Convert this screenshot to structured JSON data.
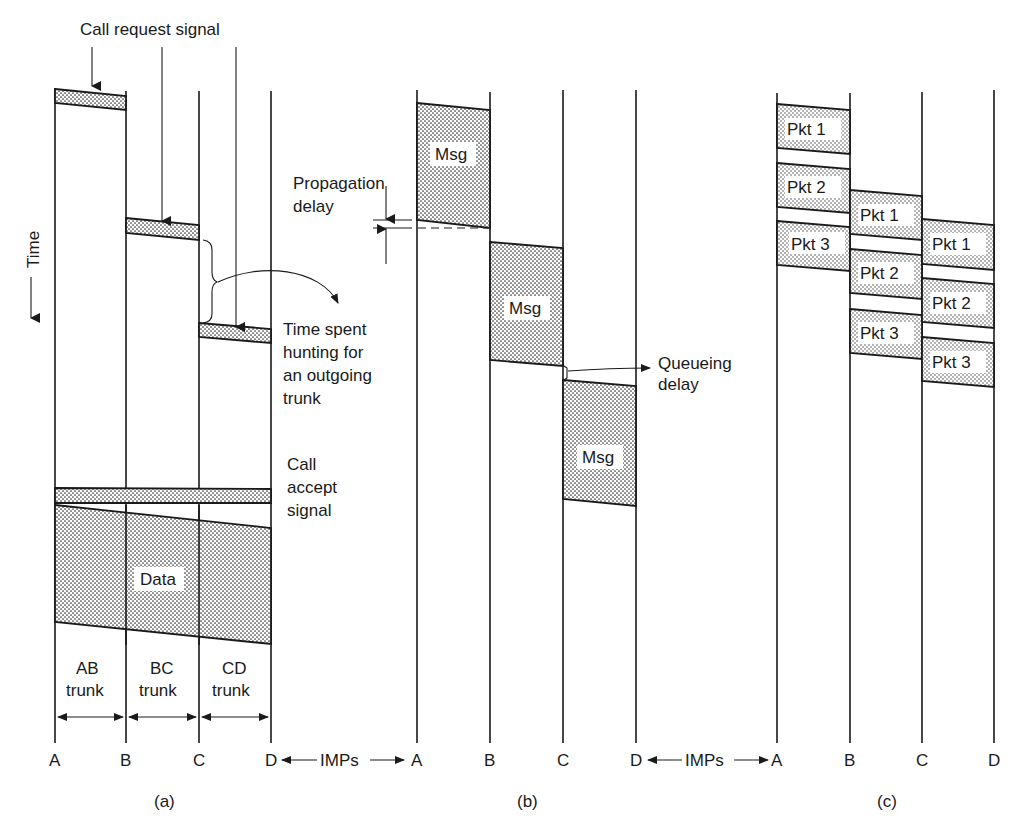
{
  "figure": {
    "time_axis_label": "Time",
    "panels": [
      {
        "id": "a",
        "caption": "(a)",
        "nodes": [
          "A",
          "B",
          "C",
          "D"
        ],
        "imps_label": "IMPs",
        "annotations": {
          "call_request": "Call request signal",
          "hunting_line1": "Time spent",
          "hunting_line2": "hunting for",
          "hunting_line3": "an outgoing",
          "hunting_line4": "trunk",
          "call_accept_line1": "Call",
          "call_accept_line2": "accept",
          "call_accept_line3": "signal",
          "data": "Data"
        },
        "trunks": [
          {
            "line1": "AB",
            "line2": "trunk"
          },
          {
            "line1": "BC",
            "line2": "trunk"
          },
          {
            "line1": "CD",
            "line2": "trunk"
          }
        ]
      },
      {
        "id": "b",
        "caption": "(b)",
        "nodes": [
          "A",
          "B",
          "C",
          "D"
        ],
        "imps_label": "IMPs",
        "annotations": {
          "propagation_line1": "Propagation",
          "propagation_line2": "delay",
          "queueing_line1": "Queueing",
          "queueing_line2": "delay",
          "msg": [
            "Msg",
            "Msg",
            "Msg"
          ]
        }
      },
      {
        "id": "c",
        "caption": "(c)",
        "nodes": [
          "A",
          "B",
          "C",
          "D"
        ],
        "packets": {
          "AB": [
            "Pkt 1",
            "Pkt 2",
            "Pkt 3"
          ],
          "BC": [
            "Pkt 1",
            "Pkt 2",
            "Pkt 3"
          ],
          "CD": [
            "Pkt 1",
            "Pkt 2",
            "Pkt 3"
          ]
        }
      }
    ]
  }
}
